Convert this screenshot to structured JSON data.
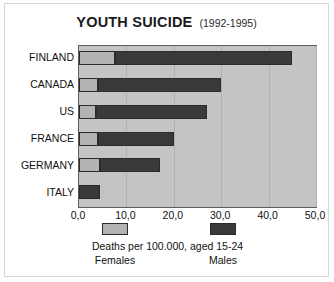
{
  "chart_data": {
    "type": "bar",
    "orientation": "horizontal",
    "stacked": true,
    "title": "YOUTH SUICIDE",
    "subtitle": "(1992-1995)",
    "xlabel": "Deaths per 100.000, aged 15-24",
    "ylabel": "",
    "xlim": [
      0,
      50
    ],
    "xticks": [
      "0,0",
      "10,0",
      "20,0",
      "30,0",
      "40,0",
      "50,0"
    ],
    "xtick_values": [
      0,
      10,
      20,
      30,
      40,
      50
    ],
    "grid": true,
    "legend_position": "bottom",
    "categories": [
      "FINLAND",
      "CANADA",
      "US",
      "FRANCE",
      "GERMANY",
      "ITALY"
    ],
    "series": [
      {
        "name": "Females",
        "color": "#b3b3b3",
        "values": [
          7.5,
          4.0,
          3.5,
          4.0,
          4.5,
          0.0
        ]
      },
      {
        "name": "Males",
        "color": "#3a3a3a",
        "values": [
          37.5,
          26.0,
          23.5,
          16.0,
          12.5,
          4.5
        ]
      }
    ],
    "totals": [
      45.0,
      30.0,
      27.0,
      20.0,
      17.0,
      4.5
    ]
  },
  "legend": {
    "female_label": "Females",
    "male_label": "Males"
  }
}
